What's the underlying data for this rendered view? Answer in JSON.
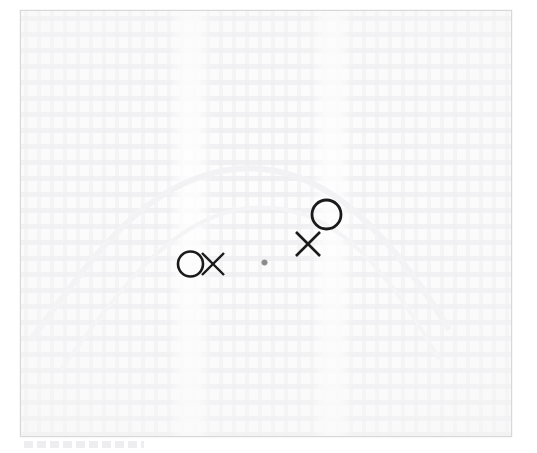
{
  "document": {
    "type": "scanned-page",
    "appearance": "faded blank scan with very faint ghost text and a thin gray frame",
    "background_color": "#ffffff",
    "page_color": "#fdfdfd",
    "frame_color": "#d8d8d8",
    "ghost_text_color": "#e2e2e6"
  },
  "canvas": {
    "width": 537,
    "height": 453,
    "page_left": 20,
    "page_top": 10,
    "page_width": 492,
    "page_height": 427
  },
  "annotations": {
    "ink_color": "#1a1a1a",
    "dot_color": "#8a8a8a",
    "marks": [
      {
        "id": "mark-1",
        "symbol": "O",
        "name": "circle-mark-left",
        "cx": 190.5,
        "cy": 264,
        "radius": 12.5,
        "stroke_width": 2.6
      },
      {
        "id": "mark-2",
        "symbol": "X",
        "name": "x-mark-left",
        "cx": 213,
        "cy": 264,
        "size": 22,
        "stroke_width": 2.4
      },
      {
        "id": "mark-3",
        "symbol": "dot",
        "name": "dot-mark-center",
        "cx": 264.5,
        "cy": 262.5,
        "radius": 2.8
      },
      {
        "id": "mark-4",
        "symbol": "X",
        "name": "x-mark-right",
        "cx": 308,
        "cy": 244,
        "size": 24,
        "stroke_width": 2.6
      },
      {
        "id": "mark-5",
        "symbol": "O",
        "name": "circle-mark-right",
        "cx": 326.5,
        "cy": 214.5,
        "radius": 14.5,
        "stroke_width": 2.8
      }
    ]
  }
}
